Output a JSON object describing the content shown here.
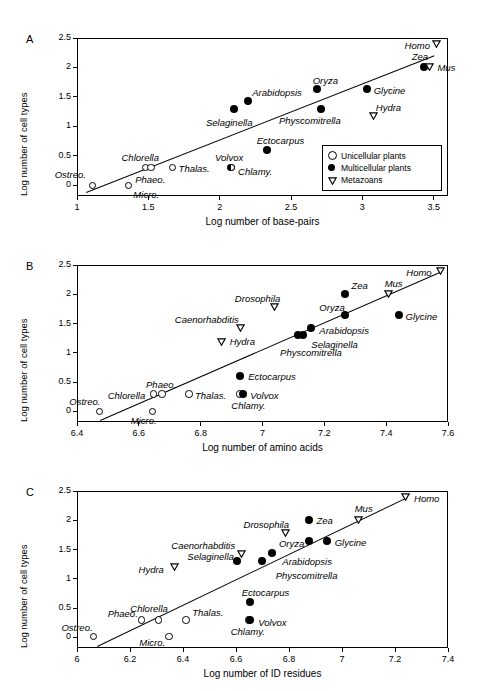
{
  "figure": {
    "panels": [
      "A",
      "B",
      "C"
    ],
    "legend": {
      "items": [
        {
          "symbol": "open-circle",
          "label": "Unicellular plants"
        },
        {
          "symbol": "filled-circle",
          "label": "Multicellular plants"
        },
        {
          "symbol": "open-triangle-down",
          "label": "Metazoans"
        }
      ]
    }
  },
  "chart_data": [
    {
      "type": "scatter",
      "panel": "A",
      "title": "",
      "xlabel": "Log number of  base-pairs",
      "ylabel": "Log number of cell types",
      "xlim": [
        1,
        3.6
      ],
      "ylim": [
        -0.18,
        2.5
      ],
      "xticks": [
        "1",
        "1.5",
        "2",
        "2.5",
        "3",
        "3.5"
      ],
      "xtick_values": [
        1,
        1.5,
        2,
        2.5,
        3,
        3.5
      ],
      "yticks": [
        "0",
        "0.5",
        "1",
        "1.5",
        "2",
        "2.5"
      ],
      "ytick_values": [
        0,
        0.5,
        1,
        1.5,
        2,
        2.5
      ],
      "grid": false,
      "legend_position": "bottom-right",
      "trendline": {
        "x0": 1.06,
        "y0": -0.12,
        "x1": 3.5,
        "y1": 2.2
      },
      "points": [
        {
          "name": "Ostreo.",
          "group": "Unicellular plants",
          "symbol": "open-circle",
          "x": 1.11,
          "y": 0.0,
          "label_dx": -38,
          "label_dy": -16
        },
        {
          "name": "Micro.",
          "group": "Unicellular plants",
          "symbol": "open-circle",
          "x": 1.36,
          "y": 0.0,
          "label_dx": 5,
          "label_dy": 4
        },
        {
          "name": "Chlorella",
          "group": "Unicellular plants",
          "symbol": "open-circle",
          "x": 1.48,
          "y": 0.3,
          "label_dx": -24,
          "label_dy": -16
        },
        {
          "name": "Phaeo.",
          "group": "Unicellular plants",
          "symbol": "open-circle",
          "x": 1.52,
          "y": 0.3,
          "label_dx": -16,
          "label_dy": 6
        },
        {
          "name": "Thalas.",
          "group": "Unicellular plants",
          "symbol": "open-circle",
          "x": 1.67,
          "y": 0.3,
          "label_dx": 6,
          "label_dy": -5
        },
        {
          "name": "Volvox",
          "group": "Multicellular plants",
          "symbol": "half-circle",
          "x": 2.08,
          "y": 0.3,
          "label_dx": -16,
          "label_dy": -16
        },
        {
          "name": "Chlamy.",
          "group": "Unicellular plants",
          "symbol": "half-circle",
          "x": 2.08,
          "y": 0.3,
          "label_dx": 7,
          "label_dy": -2
        },
        {
          "name": "Selaginella",
          "group": "Multicellular plants",
          "symbol": "filled-circle",
          "x": 2.1,
          "y": 1.3,
          "label_dx": -28,
          "label_dy": 8
        },
        {
          "name": "Arabidopsis",
          "group": "Multicellular plants",
          "symbol": "filled-circle",
          "x": 2.2,
          "y": 1.43,
          "label_dx": 4,
          "label_dy": -14
        },
        {
          "name": "Ectocarpus",
          "group": "Multicellular plants",
          "symbol": "filled-circle",
          "x": 2.33,
          "y": 0.6,
          "label_dx": -10,
          "label_dy": -15
        },
        {
          "name": "Oryza",
          "group": "Multicellular plants",
          "symbol": "filled-circle",
          "x": 2.68,
          "y": 1.64,
          "label_dx": -4,
          "label_dy": -14
        },
        {
          "name": "Physcomitrella",
          "group": "Multicellular plants",
          "symbol": "filled-circle",
          "x": 2.71,
          "y": 1.3,
          "label_dx": -42,
          "label_dy": 6
        },
        {
          "name": "Glycine",
          "group": "Multicellular plants",
          "symbol": "filled-circle",
          "x": 3.03,
          "y": 1.64,
          "label_dx": 7,
          "label_dy": -4
        },
        {
          "name": "Hydra",
          "group": "Metazoans",
          "symbol": "open-triangle-down",
          "x": 3.08,
          "y": 1.18,
          "label_dx": 2,
          "label_dy": -14
        },
        {
          "name": "Zea",
          "group": "Multicellular plants",
          "symbol": "filled-circle",
          "x": 3.43,
          "y": 2.0,
          "label_dx": -12,
          "label_dy": -16
        },
        {
          "name": "Mus",
          "group": "Metazoans",
          "symbol": "open-triangle-down",
          "x": 3.47,
          "y": 2.0,
          "label_dx": 8,
          "label_dy": -5
        },
        {
          "name": "Homo",
          "group": "Metazoans",
          "symbol": "open-triangle-down",
          "x": 3.52,
          "y": 2.4,
          "label_dx": -32,
          "label_dy": -4
        }
      ]
    },
    {
      "type": "scatter",
      "panel": "B",
      "title": "",
      "xlabel": "Log number of  amino acids",
      "ylabel": "Log number of cell types",
      "xlim": [
        6.4,
        7.6
      ],
      "ylim": [
        -0.18,
        2.5
      ],
      "xticks": [
        "6.4",
        "6.6",
        "6.8",
        "7",
        "7.2",
        "7.4",
        "7.6"
      ],
      "xtick_values": [
        6.4,
        6.6,
        6.8,
        7.0,
        7.2,
        7.4,
        7.6
      ],
      "yticks": [
        "0",
        "0.5",
        "1",
        "1.5",
        "2",
        "2.5"
      ],
      "ytick_values": [
        0,
        0.5,
        1,
        1.5,
        2,
        2.5
      ],
      "grid": false,
      "legend_position": "none",
      "trendline": {
        "x0": 6.475,
        "y0": -0.14,
        "x1": 7.58,
        "y1": 2.4
      },
      "points": [
        {
          "name": "Ostreo.",
          "group": "Unicellular plants",
          "symbol": "open-circle",
          "x": 6.472,
          "y": 0.0,
          "label_dx": -30,
          "label_dy": -15
        },
        {
          "name": "Micro.",
          "group": "Unicellular plants",
          "symbol": "open-circle",
          "x": 6.645,
          "y": 0.0,
          "label_dx": -22,
          "label_dy": 4
        },
        {
          "name": "Chlorella",
          "group": "Unicellular plants",
          "symbol": "open-circle",
          "x": 6.648,
          "y": 0.3,
          "label_dx": -46,
          "label_dy": -4
        },
        {
          "name": "Phaeo.",
          "group": "Unicellular plants",
          "symbol": "open-circle",
          "x": 6.675,
          "y": 0.3,
          "label_dx": -16,
          "label_dy": -15
        },
        {
          "name": "Thalas.",
          "group": "Unicellular plants",
          "symbol": "open-circle",
          "x": 6.762,
          "y": 0.3,
          "label_dx": 6,
          "label_dy": -4
        },
        {
          "name": "Chlamy.",
          "group": "Unicellular plants",
          "symbol": "open-circle",
          "x": 6.925,
          "y": 0.3,
          "label_dx": -8,
          "label_dy": 6
        },
        {
          "name": "Volvox",
          "group": "Multicellular plants",
          "symbol": "filled-circle",
          "x": 6.938,
          "y": 0.3,
          "label_dx": 7,
          "label_dy": -4
        },
        {
          "name": "Ectocarpus",
          "group": "Multicellular plants",
          "symbol": "filled-circle",
          "x": 6.928,
          "y": 0.6,
          "label_dx": 8,
          "label_dy": -5
        },
        {
          "name": "Hydra",
          "group": "Metazoans",
          "symbol": "open-triangle-down",
          "x": 6.868,
          "y": 1.18,
          "label_dx": 8,
          "label_dy": -6
        },
        {
          "name": "Caenorhabditis",
          "group": "Metazoans",
          "symbol": "open-triangle-down",
          "x": 6.93,
          "y": 1.43,
          "label_dx": -66,
          "label_dy": -14
        },
        {
          "name": "Physcomitrella",
          "group": "Multicellular plants",
          "symbol": "filled-circle",
          "x": 7.115,
          "y": 1.3,
          "label_dx": -18,
          "label_dy": 12
        },
        {
          "name": "Selaginella",
          "group": "Multicellular plants",
          "symbol": "filled-circle",
          "x": 7.132,
          "y": 1.3,
          "label_dx": 8,
          "label_dy": 4
        },
        {
          "name": "Arabidopsis",
          "group": "Multicellular plants",
          "symbol": "filled-circle",
          "x": 7.158,
          "y": 1.43,
          "label_dx": 8,
          "label_dy": -3
        },
        {
          "name": "Drosophila",
          "group": "Metazoans",
          "symbol": "open-triangle-down",
          "x": 7.04,
          "y": 1.78,
          "label_dx": -40,
          "label_dy": -14
        },
        {
          "name": "Oryza",
          "group": "Multicellular plants",
          "symbol": "filled-circle",
          "x": 7.268,
          "y": 1.64,
          "label_dx": -26,
          "label_dy": -13
        },
        {
          "name": "Zea",
          "group": "Multicellular plants",
          "symbol": "filled-circle",
          "x": 7.268,
          "y": 2.0,
          "label_dx": 6,
          "label_dy": -14
        },
        {
          "name": "Mus",
          "group": "Metazoans",
          "symbol": "open-triangle-down",
          "x": 7.408,
          "y": 2.0,
          "label_dx": -4,
          "label_dy": -16
        },
        {
          "name": "Glycine",
          "group": "Multicellular plants",
          "symbol": "filled-circle",
          "x": 7.44,
          "y": 1.64,
          "label_dx": 7,
          "label_dy": -4
        },
        {
          "name": "Homo",
          "group": "Metazoans",
          "symbol": "open-triangle-down",
          "x": 7.575,
          "y": 2.4,
          "label_dx": -34,
          "label_dy": -4
        }
      ]
    },
    {
      "type": "scatter",
      "panel": "C",
      "title": "",
      "xlabel": "Log number of ID residues",
      "ylabel": "Log number of cell types",
      "xlim": [
        6.0,
        7.4
      ],
      "ylim": [
        -0.18,
        2.5
      ],
      "xticks": [
        "6",
        "6.2",
        "6.4",
        "6.6",
        "6.8",
        "7",
        "7.2",
        "7.4"
      ],
      "xtick_values": [
        6.0,
        6.2,
        6.4,
        6.6,
        6.8,
        7.0,
        7.2,
        7.4
      ],
      "yticks": [
        "0",
        "0.5",
        "1",
        "1.5",
        "2",
        "2.5"
      ],
      "ytick_values": [
        0,
        0.5,
        1,
        1.5,
        2,
        2.5
      ],
      "grid": false,
      "legend_position": "none",
      "trendline": {
        "x0": 6.075,
        "y0": -0.14,
        "x1": 7.245,
        "y1": 2.4
      },
      "points": [
        {
          "name": "Ostreo.",
          "group": "Unicellular plants",
          "symbol": "open-circle",
          "x": 6.062,
          "y": 0.02,
          "label_dx": -32,
          "label_dy": -14
        },
        {
          "name": "Phaeo.",
          "group": "Unicellular plants",
          "symbol": "open-circle",
          "x": 6.244,
          "y": 0.3,
          "label_dx": -34,
          "label_dy": -12
        },
        {
          "name": "Chlorella",
          "group": "Unicellular plants",
          "symbol": "open-circle",
          "x": 6.307,
          "y": 0.3,
          "label_dx": -28,
          "label_dy": -17
        },
        {
          "name": "Micro.",
          "group": "Unicellular plants",
          "symbol": "open-circle",
          "x": 6.348,
          "y": 0.02,
          "label_dx": -30,
          "label_dy": 1
        },
        {
          "name": "Thalas.",
          "group": "Unicellular plants",
          "symbol": "open-circle",
          "x": 6.412,
          "y": 0.3,
          "label_dx": 6,
          "label_dy": -13
        },
        {
          "name": "Chlamy.",
          "group": "Unicellular plants",
          "symbol": "open-circle",
          "x": 6.648,
          "y": 0.3,
          "label_dx": -18,
          "label_dy": 6
        },
        {
          "name": "Volvox",
          "group": "Multicellular plants",
          "symbol": "filled-circle",
          "x": 6.654,
          "y": 0.3,
          "label_dx": 8,
          "label_dy": -3
        },
        {
          "name": "Ectocarpus",
          "group": "Multicellular plants",
          "symbol": "filled-circle",
          "x": 6.652,
          "y": 0.6,
          "label_dx": -8,
          "label_dy": -15
        },
        {
          "name": "Hydra",
          "group": "Metazoans",
          "symbol": "open-triangle-down",
          "x": 6.368,
          "y": 1.2,
          "label_dx": -36,
          "label_dy": -3
        },
        {
          "name": "Selaginella",
          "group": "Multicellular plants",
          "symbol": "filled-circle",
          "x": 6.605,
          "y": 1.3,
          "label_dx": -50,
          "label_dy": -10
        },
        {
          "name": "Caenorhabditis",
          "group": "Metazoans",
          "symbol": "open-triangle-down",
          "x": 6.62,
          "y": 1.43,
          "label_dx": -70,
          "label_dy": -14
        },
        {
          "name": "Physcomitrella",
          "group": "Multicellular plants",
          "symbol": "filled-circle",
          "x": 6.697,
          "y": 1.31,
          "label_dx": 14,
          "label_dy": 9
        },
        {
          "name": "Arabidopsis",
          "group": "Multicellular plants",
          "symbol": "filled-circle",
          "x": 6.737,
          "y": 1.44,
          "label_dx": 10,
          "label_dy": 3
        },
        {
          "name": "Drosophila",
          "group": "Metazoans",
          "symbol": "open-triangle-down",
          "x": 6.787,
          "y": 1.78,
          "label_dx": -42,
          "label_dy": -14
        },
        {
          "name": "Oryza",
          "group": "Multicellular plants",
          "symbol": "filled-circle",
          "x": 6.875,
          "y": 1.64,
          "label_dx": -30,
          "label_dy": -3
        },
        {
          "name": "Zea",
          "group": "Multicellular plants",
          "symbol": "filled-circle",
          "x": 6.877,
          "y": 2.0,
          "label_dx": 7,
          "label_dy": -5
        },
        {
          "name": "Glycine",
          "group": "Multicellular plants",
          "symbol": "filled-circle",
          "x": 6.942,
          "y": 1.64,
          "label_dx": 8,
          "label_dy": -4
        },
        {
          "name": "Mus",
          "group": "Metazoans",
          "symbol": "open-triangle-down",
          "x": 7.063,
          "y": 2.0,
          "label_dx": -4,
          "label_dy": -17
        },
        {
          "name": "Homo",
          "group": "Metazoans",
          "symbol": "open-triangle-down",
          "x": 7.238,
          "y": 2.4,
          "label_dx": 9,
          "label_dy": -4
        }
      ]
    }
  ]
}
